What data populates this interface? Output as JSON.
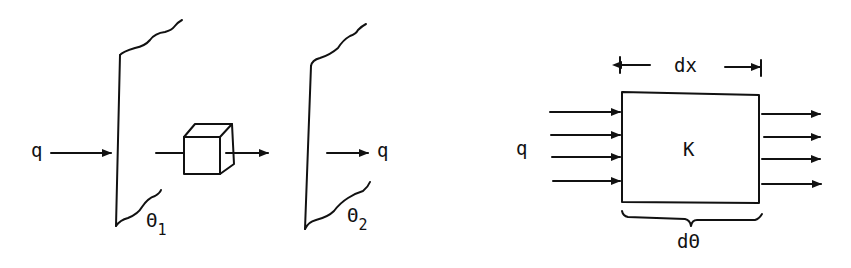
{
  "figure": {
    "left_panel": {
      "incoming_flux_label": "q",
      "outgoing_flux_label": "q",
      "wall1_temperature": {
        "symbol": "Θ",
        "subscript": "1"
      },
      "wall2_temperature": {
        "symbol": "Θ",
        "subscript": "2"
      }
    },
    "right_panel": {
      "flux_label": "q",
      "width_label": "dx",
      "conductivity_label": "K",
      "temperature_diff_label": "dΘ",
      "incoming_arrows": 4,
      "outgoing_arrows": 4
    },
    "colors": {
      "ink": "#111111",
      "background": "#ffffff"
    }
  }
}
